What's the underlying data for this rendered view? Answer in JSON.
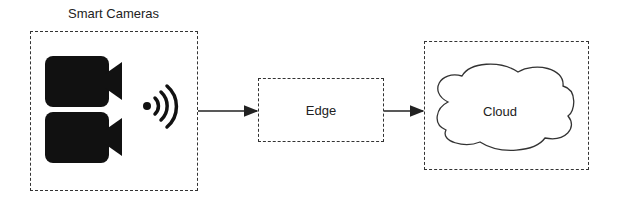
{
  "diagram": {
    "nodes": [
      {
        "id": "smart-cameras",
        "label": "Smart Cameras",
        "icons": [
          "video-camera-icon",
          "video-camera-icon",
          "wireless-signal-icon"
        ]
      },
      {
        "id": "edge",
        "label": "Edge"
      },
      {
        "id": "cloud",
        "label": "Cloud",
        "shape": "cloud"
      }
    ],
    "edges": [
      {
        "from": "smart-cameras",
        "to": "edge"
      },
      {
        "from": "edge",
        "to": "cloud"
      }
    ]
  },
  "colors": {
    "stroke": "#333333",
    "icon": "#111111"
  }
}
